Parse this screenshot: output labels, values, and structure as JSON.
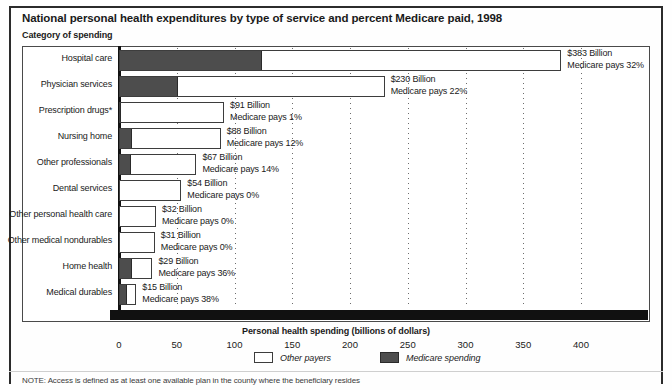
{
  "header": {
    "title": "National personal health expenditures by type of service and percent Medicare paid, 1998",
    "subtitle": "Category of spending"
  },
  "legend": {
    "other_label": "Other payers",
    "medicare_label": "Medicare spending",
    "other_color": "#ffffff",
    "medicare_color": "#4d4d4d"
  },
  "footer": {
    "note": "NOTE: Access is defined as at least one available plan in the county where the beneficiary resides"
  },
  "chart_data": {
    "type": "bar",
    "orientation": "horizontal",
    "stacked": true,
    "title": "National personal health expenditures by type of service and percent Medicare paid, 1998",
    "ylabel": "Category of spending",
    "xlabel": "Personal health spending (billions of dollars)",
    "xlim": [
      0,
      420
    ],
    "xticks": [
      0,
      50,
      100,
      150,
      200,
      250,
      300,
      350,
      400
    ],
    "xtick_labels": [
      "0",
      "50",
      "100",
      "150",
      "200",
      "250",
      "300",
      "350",
      "400"
    ],
    "grid": "vertical-dotted",
    "legend_position": "bottom-center",
    "categories": [
      "Hospital care",
      "Physician services",
      "Prescription drugs*",
      "Nursing home",
      "Other professionals",
      "Dental services",
      "Other personal health care",
      "Other medical nondurables",
      "Home health",
      "Medical durables"
    ],
    "series": [
      {
        "name": "Medicare spending",
        "values": [
          122.6,
          50.6,
          0.9,
          10.6,
          9.4,
          0.0,
          0.0,
          0.0,
          10.4,
          5.7
        ]
      },
      {
        "name": "Other payers",
        "values": [
          260.4,
          179.4,
          90.1,
          77.4,
          57.6,
          54.0,
          32.0,
          31.0,
          18.6,
          9.3
        ]
      }
    ],
    "totals": [
      383,
      230,
      91,
      88,
      67,
      54,
      32,
      31,
      29,
      15
    ],
    "medicare_percent": [
      32,
      22,
      1,
      12,
      14,
      0,
      0,
      0,
      36,
      38
    ],
    "value_labels": [
      {
        "amount": "$383 Billion",
        "share": "Medicare pays 32%"
      },
      {
        "amount": "$230 Billion",
        "share": "Medicare pays 22%"
      },
      {
        "amount": "$91 Billion",
        "share": "Medicare pays 1%"
      },
      {
        "amount": "$88 Billion",
        "share": "Medicare pays 12%"
      },
      {
        "amount": "$67 Billion",
        "share": "Medicare pays 14%"
      },
      {
        "amount": "$54 Billion",
        "share": "Medicare pays 0%"
      },
      {
        "amount": "$32 Billion",
        "share": "Medicare pays 0%"
      },
      {
        "amount": "$31 Billion",
        "share": "Medicare pays 0%"
      },
      {
        "amount": "$29 Billion",
        "share": "Medicare pays 36%"
      },
      {
        "amount": "$15 Billion",
        "share": "Medicare pays 38%"
      }
    ]
  }
}
